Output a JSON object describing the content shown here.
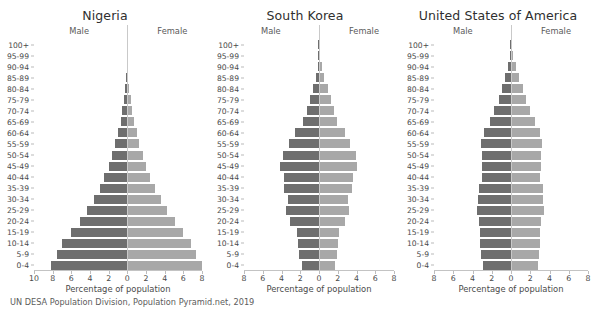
{
  "footnote": "UN DESA Population Division, Population Pyramid.net, 2019",
  "axis_title": "Percentage of population",
  "male_label": "Male",
  "female_label": "Female",
  "colors": {
    "male": "#6e6e6e",
    "female": "#a8a8a8",
    "background": "#ffffff",
    "text": "#4a4a4a",
    "axis": "#c3c3c3"
  },
  "age_groups": [
    "100+",
    "95-99",
    "90-94",
    "85-89",
    "80-84",
    "75-79",
    "70-74",
    "65-69",
    "60-64",
    "55-59",
    "50-54",
    "45-49",
    "40-44",
    "35-39",
    "30-34",
    "25-29",
    "20-24",
    "15-19",
    "10-14",
    "5-9",
    "0-4"
  ],
  "chart_data": [
    {
      "type": "bar",
      "title": "Nigeria",
      "xlabel": "Percentage of population",
      "ylabel": "",
      "orientation": "population-pyramid",
      "grid": false,
      "legend_position": "inline-top",
      "xlim": [
        -10,
        8
      ],
      "xticks": [
        -10,
        -8,
        -6,
        -4,
        -2,
        0,
        2,
        4,
        6,
        8
      ],
      "xticklabels": [
        "10",
        "8",
        "6",
        "4",
        "2",
        "0",
        "2",
        "4",
        "6",
        "8"
      ],
      "categories": [
        "100+",
        "95-99",
        "90-94",
        "85-89",
        "80-84",
        "75-79",
        "70-74",
        "65-69",
        "60-64",
        "55-59",
        "50-54",
        "45-49",
        "40-44",
        "35-39",
        "30-34",
        "25-29",
        "20-24",
        "15-19",
        "10-14",
        "5-9",
        "0-4"
      ],
      "series": [
        {
          "name": "Male",
          "values": [
            0.01,
            0.02,
            0.05,
            0.1,
            0.2,
            0.33,
            0.52,
            0.73,
            0.98,
            1.28,
            1.62,
            2.0,
            2.45,
            2.98,
            3.6,
            4.3,
            5.1,
            6.0,
            6.95,
            7.5,
            8.15
          ]
        },
        {
          "name": "Female",
          "values": [
            0.01,
            0.02,
            0.05,
            0.11,
            0.21,
            0.34,
            0.53,
            0.74,
            1.0,
            1.3,
            1.64,
            2.02,
            2.47,
            3.0,
            3.6,
            4.3,
            5.1,
            5.95,
            6.85,
            7.4,
            8.0
          ]
        }
      ]
    },
    {
      "type": "bar",
      "title": "South Korea",
      "xlabel": "Percentage of population",
      "ylabel": "",
      "orientation": "population-pyramid",
      "grid": false,
      "legend_position": "inline-top",
      "xlim": [
        -8,
        8
      ],
      "xticks": [
        -8,
        -6,
        -4,
        -2,
        0,
        2,
        4,
        6,
        8
      ],
      "xticklabels": [
        "8",
        "6",
        "4",
        "2",
        "0",
        "2",
        "4",
        "6",
        "8"
      ],
      "categories": [
        "100+",
        "95-99",
        "90-94",
        "85-89",
        "80-84",
        "75-79",
        "70-74",
        "65-69",
        "60-64",
        "55-59",
        "50-54",
        "45-49",
        "40-44",
        "35-39",
        "30-34",
        "25-29",
        "20-24",
        "15-19",
        "10-14",
        "5-9",
        "0-4"
      ],
      "series": [
        {
          "name": "Male",
          "values": [
            0.01,
            0.04,
            0.14,
            0.32,
            0.6,
            0.95,
            1.3,
            1.75,
            2.6,
            3.25,
            3.85,
            4.15,
            3.75,
            3.75,
            3.35,
            3.5,
            3.1,
            2.35,
            2.2,
            2.1,
            1.85
          ]
        },
        {
          "name": "Female",
          "values": [
            0.03,
            0.12,
            0.3,
            0.55,
            0.92,
            1.25,
            1.6,
            1.95,
            2.75,
            3.35,
            3.9,
            4.05,
            3.6,
            3.55,
            3.1,
            3.2,
            2.8,
            2.15,
            2.0,
            1.95,
            1.75
          ]
        }
      ]
    },
    {
      "type": "bar",
      "title": "United States of America",
      "xlabel": "Percentage of population",
      "ylabel": "",
      "orientation": "population-pyramid",
      "grid": false,
      "legend_position": "inline-top",
      "xlim": [
        -8,
        8
      ],
      "xticks": [
        -8,
        -6,
        -4,
        -2,
        0,
        2,
        4,
        6,
        8
      ],
      "xticklabels": [
        "8",
        "6",
        "4",
        "2",
        "0",
        "2",
        "4",
        "6",
        "8"
      ],
      "categories": [
        "100+",
        "95-99",
        "90-94",
        "85-89",
        "80-84",
        "75-79",
        "70-74",
        "65-69",
        "60-64",
        "55-59",
        "50-54",
        "45-49",
        "40-44",
        "35-39",
        "30-34",
        "25-29",
        "20-24",
        "15-19",
        "10-14",
        "5-9",
        "0-4"
      ],
      "series": [
        {
          "name": "Male",
          "values": [
            0.02,
            0.1,
            0.28,
            0.58,
            0.9,
            1.25,
            1.75,
            2.2,
            2.85,
            3.1,
            3.05,
            3.05,
            3.05,
            3.3,
            3.4,
            3.55,
            3.3,
            3.2,
            3.2,
            3.1,
            2.95
          ]
        },
        {
          "name": "Female",
          "values": [
            0.05,
            0.2,
            0.48,
            0.85,
            1.2,
            1.55,
            2.0,
            2.45,
            3.05,
            3.25,
            3.15,
            3.1,
            3.05,
            3.3,
            3.35,
            3.45,
            3.15,
            3.05,
            3.05,
            2.95,
            2.85
          ]
        }
      ]
    }
  ]
}
